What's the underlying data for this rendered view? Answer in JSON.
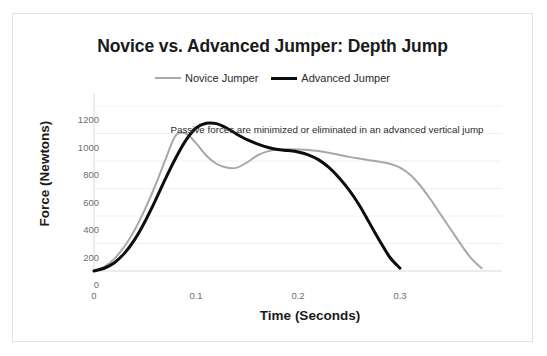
{
  "chart_data": {
    "type": "line",
    "title": "Novice vs. Advanced Jumper:  Depth Jump",
    "xlabel": "Time (Seconds)",
    "ylabel": "Force (Newtons)",
    "xlim": [
      0,
      0.4
    ],
    "ylim": [
      0,
      1200
    ],
    "grid": true,
    "grid_axis": "y",
    "legend_position": "top-center",
    "annotations": [
      {
        "text": "Passive forces are minimized or eliminated in an advanced vertical jump",
        "x": 0.185,
        "y": 1130
      }
    ],
    "y_ticks": [
      0,
      200,
      400,
      600,
      800,
      1000,
      1200
    ],
    "y_tick_labels": [
      "0",
      "200",
      "400",
      "600",
      "800",
      "1000",
      "1200"
    ],
    "x_ticks": [
      0,
      0.1,
      0.2,
      0.3
    ],
    "x_tick_labels": [
      "0",
      "0.1",
      "0.2",
      "0.3"
    ],
    "series": [
      {
        "name": "Novice Jumper",
        "color": "#a8a8a8",
        "line_width": 2,
        "x": [
          0,
          0.01,
          0.02,
          0.03,
          0.04,
          0.05,
          0.06,
          0.07,
          0.08,
          0.09,
          0.1,
          0.11,
          0.12,
          0.13,
          0.14,
          0.15,
          0.16,
          0.17,
          0.18,
          0.19,
          0.2,
          0.21,
          0.22,
          0.23,
          0.24,
          0.25,
          0.26,
          0.27,
          0.28,
          0.29,
          0.3,
          0.31,
          0.32,
          0.33,
          0.34,
          0.35,
          0.36,
          0.37,
          0.38
        ],
        "y": [
          0,
          30,
          90,
          180,
          300,
          450,
          620,
          810,
          985,
          1000,
          930,
          840,
          780,
          752,
          752,
          790,
          840,
          870,
          884,
          886,
          884,
          880,
          872,
          860,
          846,
          830,
          818,
          806,
          794,
          780,
          752,
          700,
          620,
          520,
          410,
          300,
          190,
          90,
          20
        ]
      },
      {
        "name": "Advanced Jumper",
        "color": "#0d0d0d",
        "line_width": 3,
        "x": [
          0,
          0.01,
          0.02,
          0.03,
          0.04,
          0.05,
          0.06,
          0.07,
          0.08,
          0.09,
          0.1,
          0.11,
          0.12,
          0.13,
          0.14,
          0.15,
          0.16,
          0.17,
          0.18,
          0.19,
          0.2,
          0.21,
          0.22,
          0.23,
          0.24,
          0.25,
          0.26,
          0.27,
          0.28,
          0.29,
          0.3
        ],
        "y": [
          0,
          20,
          60,
          130,
          230,
          360,
          510,
          670,
          820,
          950,
          1040,
          1074,
          1072,
          1040,
          995,
          955,
          925,
          900,
          884,
          876,
          866,
          845,
          810,
          755,
          680,
          590,
          480,
          350,
          220,
          100,
          20
        ]
      }
    ]
  },
  "legend": {
    "items": [
      {
        "label": "Novice Jumper",
        "color": "#a8a8a8"
      },
      {
        "label": "Advanced Jumper",
        "color": "#0d0d0d"
      }
    ]
  }
}
